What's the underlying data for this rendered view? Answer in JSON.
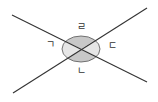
{
  "diagram": {
    "type": "intersecting-lines-angles",
    "lines": [
      {
        "name": "line-1",
        "x1": 12,
        "y1": 15,
        "x2": 147,
        "y2": 82
      },
      {
        "name": "line-2",
        "x1": 13,
        "y1": 93,
        "x2": 147,
        "y2": 8
      }
    ],
    "intersection": {
      "x": 81,
      "y": 49
    },
    "circle": {
      "cx": 81,
      "cy": 49,
      "rx": 19,
      "ry": 13
    },
    "colors": {
      "line": "#333333",
      "vertical_angle_fill": "#c8c8c8",
      "side_angle_fill": "#e6e6e6",
      "circle_stroke": "#555555"
    },
    "labels": {
      "left": {
        "text": "ㄱ",
        "x": 50,
        "y": 45
      },
      "bottom": {
        "text": "ㄴ",
        "x": 81,
        "y": 71
      },
      "right": {
        "text": "ㄷ",
        "x": 112,
        "y": 46
      },
      "top": {
        "text": "ㄹ",
        "x": 81,
        "y": 27
      }
    }
  }
}
